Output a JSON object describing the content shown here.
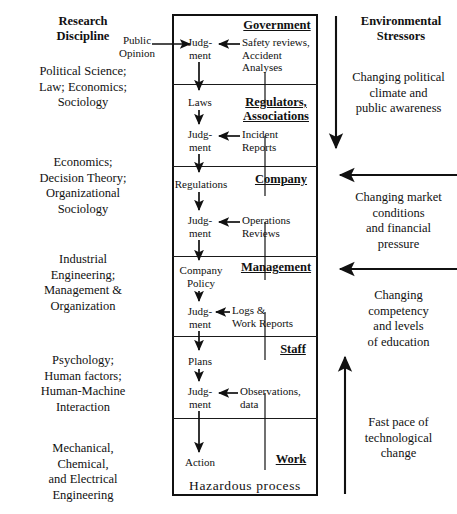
{
  "left_column": {
    "heading": "Research\nDiscipline",
    "heading_line1": "Research",
    "heading_line2": "Discipline",
    "items": [
      {
        "text": "Political Science;\nLaw; Economics;\nSociology"
      },
      {
        "text": "Economics;\nDecision Theory;\nOrganizational\nSociology"
      },
      {
        "text": "Industrial\nEngineering;\nManagement &\nOrganization"
      },
      {
        "text": "Psychology;\nHuman factors;\nHuman-Machine\nInteraction"
      },
      {
        "text": "Mechanical,\nChemical,\nand Electrical\nEngineering"
      }
    ]
  },
  "right_column": {
    "heading_line1": "Environmental",
    "heading_line2": "Stressors",
    "items": [
      {
        "text": "Changing political\nclimate and\npublic awareness"
      },
      {
        "text": "Changing market\nconditions\nand financial\npressure"
      },
      {
        "text": "Changing\ncompetency\nand levels\nof education"
      },
      {
        "text": "Fast pace of\ntechnological\nchange"
      }
    ]
  },
  "levels": [
    {
      "title": "Government",
      "title_line1": "Government",
      "title_line2": ""
    },
    {
      "title": "Regulators, Associations",
      "title_line1": "Regulators,",
      "title_line2": "Associations"
    },
    {
      "title": "Company",
      "title_line1": "Company",
      "title_line2": ""
    },
    {
      "title": "Management",
      "title_line1": "Management",
      "title_line2": ""
    },
    {
      "title": "Staff",
      "title_line1": "Staff",
      "title_line2": ""
    },
    {
      "title": "Work",
      "title_line1": "Work",
      "title_line2": ""
    }
  ],
  "flow": {
    "judgment_line1": "Judg-",
    "judgment_line2": "ment",
    "judgment_single": "Judgment",
    "outputs": [
      {
        "label": "Laws"
      },
      {
        "label": "Regulations"
      },
      {
        "label_line1": "Company",
        "label_line2": "Policy"
      },
      {
        "label": "Plans"
      },
      {
        "label": "Action"
      }
    ],
    "hazardous_process": "Hazardous  process"
  },
  "feedback": [
    {
      "line1": "Safety reviews,",
      "line2": "Accident",
      "line3": "Analyses"
    },
    {
      "line1": "Incident",
      "line2": "Reports"
    },
    {
      "line1": "Operations",
      "line2": "Reviews"
    },
    {
      "line1": "Logs &",
      "line2": "Work Reports"
    },
    {
      "line1": "Observations,",
      "line2": "data"
    }
  ],
  "external_input": {
    "line1": "Public",
    "line2": "Opinion"
  },
  "colors": {
    "ink": "#111111",
    "background": "#ffffff",
    "rule": "#1a1a1a"
  }
}
